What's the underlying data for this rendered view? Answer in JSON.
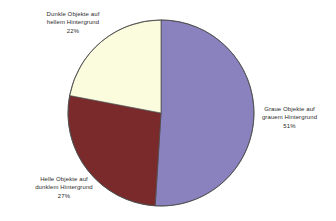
{
  "chart_data": {
    "type": "pie",
    "title": "",
    "subtitle": "",
    "xlabel": "",
    "ylabel": "",
    "legend_position": "none",
    "grid": false,
    "start_angle_deg": 0,
    "direction": "clockwise",
    "labels_outside": true,
    "categories": [
      "Graue Objekte auf grauem Hintergrund",
      "Helle Objekte auf dunklem Hintergrund",
      "Dunkle Objekte auf hellem Hintergrund"
    ],
    "values": [
      51,
      27,
      22
    ],
    "value_unit": "%",
    "colors": [
      "#8a82be",
      "#7b2a2c",
      "#fbfbdd"
    ],
    "slices": [
      {
        "name": "graue-objekte-auf-grauem-hintergrund",
        "line1": "Graue Objekte auf",
        "line2": "grauem Hintergrund",
        "percent_label": "51%",
        "value": 51,
        "color": "#8a82be"
      },
      {
        "name": "helle-objekte-auf-dunklem-hintergrund",
        "line1": "Helle Objekte auf",
        "line2": "dunklem Hintergrund",
        "percent_label": "27%",
        "value": 27,
        "color": "#7b2a2c"
      },
      {
        "name": "dunkle-objekte-auf-hellem-hintergrund",
        "line1": "Dunkle Objekte auf",
        "line2": "hellem Hintergrund",
        "percent_label": "22%",
        "value": 22,
        "color": "#fbfbdd"
      }
    ]
  },
  "style": {
    "background": "#ffffff",
    "outline_color": "#4a4a4a",
    "text_color": "#2b2b2b"
  }
}
